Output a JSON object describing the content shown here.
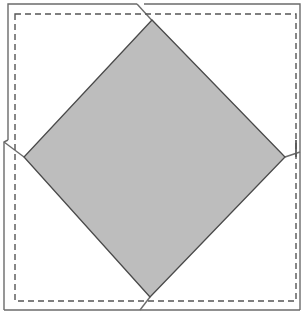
{
  "diagram": {
    "type": "folded-square-figure",
    "colors": {
      "background": "#ffffff",
      "outline": "#6b6b6b",
      "dashed": "#555555",
      "diamond_fill": "#bdbdbd",
      "diamond_stroke": "#4a4a4a"
    },
    "shapes": {
      "outer_outline": "outer-square-outline",
      "dashed_square": "dashed-inner-square",
      "diamond": "gray-rotated-square"
    }
  }
}
